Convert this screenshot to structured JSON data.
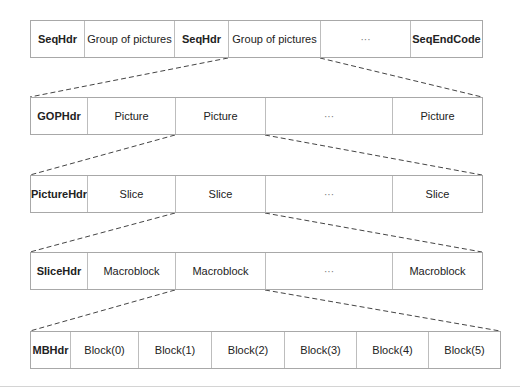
{
  "diagram": {
    "rows": [
      {
        "name": "sequence-layer",
        "cells": [
          {
            "label": "SeqHdr",
            "header": true,
            "width": 54
          },
          {
            "label": "Group of pictures",
            "width": 90
          },
          {
            "label": "SeqHdr",
            "header": true,
            "width": 54
          },
          {
            "label": "Group of pictures",
            "width": 92
          },
          {
            "label": "···",
            "ellipsis": true,
            "width": 90
          },
          {
            "label": "SeqEndCode",
            "header": true,
            "width": 73
          }
        ]
      },
      {
        "name": "gop-layer",
        "cells": [
          {
            "label": "GOPHdr",
            "header": true,
            "width": 57
          },
          {
            "label": "Picture",
            "width": 88
          },
          {
            "label": "Picture",
            "width": 90
          },
          {
            "label": "···",
            "ellipsis": true,
            "width": 127
          },
          {
            "label": "Picture",
            "width": 90
          }
        ]
      },
      {
        "name": "picture-layer",
        "cells": [
          {
            "label": "PictureHdr",
            "header": true,
            "width": 57
          },
          {
            "label": "Slice",
            "width": 88
          },
          {
            "label": "Slice",
            "width": 90
          },
          {
            "label": "···",
            "ellipsis": true,
            "width": 127
          },
          {
            "label": "Slice",
            "width": 90
          }
        ]
      },
      {
        "name": "slice-layer",
        "cells": [
          {
            "label": "SliceHdr",
            "header": true,
            "width": 57
          },
          {
            "label": "Macroblock",
            "width": 88
          },
          {
            "label": "Macroblock",
            "width": 90
          },
          {
            "label": "···",
            "ellipsis": true,
            "width": 127
          },
          {
            "label": "Macroblock",
            "width": 90
          }
        ]
      },
      {
        "name": "macroblock-layer",
        "cells": [
          {
            "label": "MBHdr",
            "header": true,
            "width": 40
          },
          {
            "label": "Block(0)",
            "width": 68
          },
          {
            "label": "Block(1)",
            "width": 73
          },
          {
            "label": "Block(2)",
            "width": 73
          },
          {
            "label": "Block(3)",
            "width": 72
          },
          {
            "label": "Block(4)",
            "width": 72
          },
          {
            "label": "Block(5)",
            "width": 72
          }
        ]
      }
    ]
  }
}
